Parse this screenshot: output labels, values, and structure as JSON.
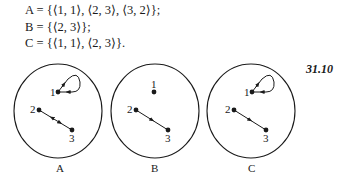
{
  "definitions": [
    {
      "name": "A",
      "text": "A = {⟨1, 1⟩, ⟨2, 3⟩, ⟨3, 2⟩};"
    },
    {
      "name": "B",
      "text": "B = {⟨2, 3⟩};"
    },
    {
      "name": "C",
      "text": "C = {⟨1, 1⟩, ⟨2, 3⟩}."
    }
  ],
  "figure_number": "31.10",
  "diagrams": [
    {
      "label": "A",
      "nodes": [
        {
          "id": "1",
          "label": "1"
        },
        {
          "id": "2",
          "label": "2"
        },
        {
          "id": "3",
          "label": "3"
        }
      ],
      "edges": [
        [
          "1",
          "1"
        ],
        [
          "2",
          "3"
        ],
        [
          "3",
          "2"
        ]
      ]
    },
    {
      "label": "B",
      "nodes": [
        {
          "id": "1",
          "label": "1"
        },
        {
          "id": "2",
          "label": "2"
        },
        {
          "id": "3",
          "label": "3"
        }
      ],
      "edges": [
        [
          "2",
          "3"
        ]
      ]
    },
    {
      "label": "C",
      "nodes": [
        {
          "id": "1",
          "label": "1"
        },
        {
          "id": "2",
          "label": "2"
        },
        {
          "id": "3",
          "label": "3"
        }
      ],
      "edges": [
        [
          "1",
          "1"
        ],
        [
          "2",
          "3"
        ]
      ]
    }
  ],
  "colors": {
    "ink": "#1a1a1a",
    "background": "#ffffff"
  }
}
